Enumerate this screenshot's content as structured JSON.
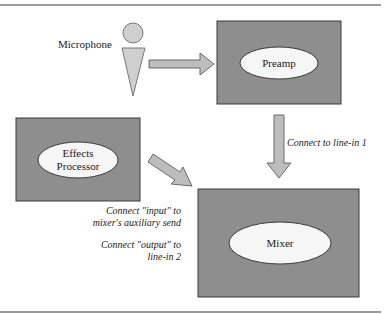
{
  "diagram": {
    "nodes": {
      "microphone": {
        "label": "Microphone"
      },
      "preamp": {
        "label": "Preamp"
      },
      "effects": {
        "label_line1": "Effects",
        "label_line2": "Processor"
      },
      "mixer": {
        "label": "Mixer"
      }
    },
    "edges": [
      {
        "from": "microphone",
        "to": "preamp",
        "label": ""
      },
      {
        "from": "preamp",
        "to": "mixer",
        "label": "Connect to line-in 1"
      },
      {
        "from": "effects",
        "to": "mixer",
        "label": ""
      }
    ],
    "notes": {
      "effects_input_line1": "Connect \"input\" to",
      "effects_input_line2": "mixer's auxiliary send",
      "effects_output_line1": "Connect \"output\" to",
      "effects_output_line2": "line-in 2"
    },
    "colors": {
      "box_fill": "#8e8e8e",
      "box_stroke": "#3a3a3a",
      "ellipse_fill": "#f6f6f6",
      "arrow_fill": "#bdbdbd",
      "arrow_stroke": "#6a6a6a",
      "rule": "#7a7a7a"
    }
  }
}
